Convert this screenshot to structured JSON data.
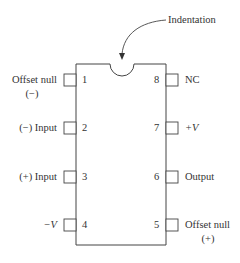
{
  "diagram": {
    "callout": "Indentation",
    "pins": [
      {
        "number": "1",
        "label": "Offset null",
        "sublabel": "(−)",
        "side": "left"
      },
      {
        "number": "2",
        "label": "(−) Input",
        "side": "left"
      },
      {
        "number": "3",
        "label": "(+) Input",
        "side": "left"
      },
      {
        "number": "4",
        "label": "−V",
        "side": "left"
      },
      {
        "number": "5",
        "label": "Offset null",
        "sublabel": "(+)",
        "side": "right"
      },
      {
        "number": "6",
        "label": "Output",
        "side": "right"
      },
      {
        "number": "7",
        "label": "+V",
        "side": "right"
      },
      {
        "number": "8",
        "label": "NC",
        "side": "right"
      }
    ]
  }
}
